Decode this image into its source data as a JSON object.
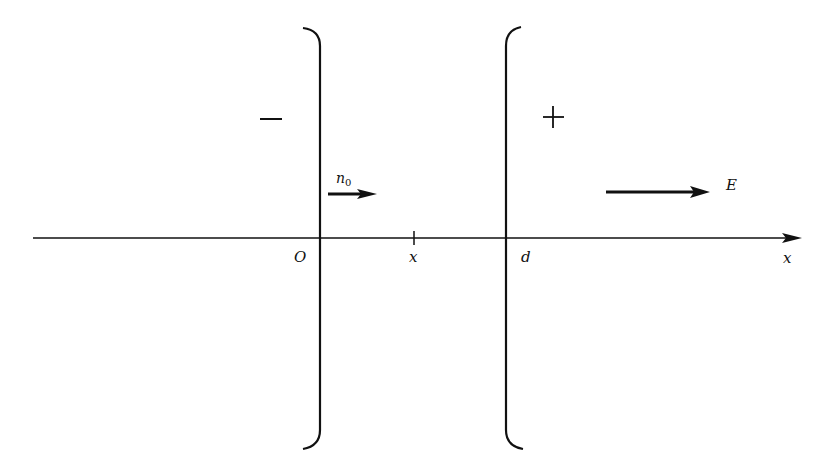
{
  "diagram": {
    "type": "parallel-plate-capacitor",
    "background": "#ffffff",
    "stroke_color": "#111111",
    "axis": {
      "label": "x",
      "origin_label": "O",
      "point_label": "x",
      "plate_label": "d"
    },
    "left_plate": {
      "sign": "−"
    },
    "right_plate": {
      "sign": "+"
    },
    "particle_flux": {
      "label": "n",
      "subscript": "0",
      "direction": "right"
    },
    "field": {
      "label": "E",
      "direction": "right"
    }
  }
}
